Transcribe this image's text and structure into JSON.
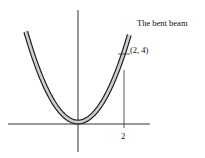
{
  "diagram": {
    "beam_label": "The bent beam",
    "point_label": "(2, 4)",
    "x_tick_label": "2",
    "curve": "y = x^2",
    "colors": {
      "beam_fill": "#cfcfcf",
      "stroke": "#222222",
      "axis": "#333333",
      "background": "#ffffff"
    }
  }
}
